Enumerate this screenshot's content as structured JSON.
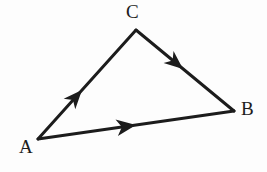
{
  "figure": {
    "kind": "vector-triangle-diagram",
    "width": 267,
    "height": 172,
    "background_color": "#fdfdfd",
    "ink_color": "#1c1c1c"
  },
  "vertices": [
    {
      "id": "A",
      "label": "A",
      "x": 38,
      "y": 139,
      "label_x": 19,
      "label_y": 137
    },
    {
      "id": "B",
      "label": "B",
      "x": 234,
      "y": 111,
      "label_x": 241,
      "label_y": 99
    },
    {
      "id": "C",
      "label": "C",
      "x": 136,
      "y": 30,
      "label_x": 126,
      "label_y": 2
    }
  ],
  "edges": [
    {
      "id": "AC",
      "from": "A",
      "to": "C",
      "x1": 38,
      "y1": 139,
      "x2": 136,
      "y2": 30,
      "arrow_position": 0.45,
      "arrow_x": 82,
      "arrow_y": 90,
      "stroke_width": 3
    },
    {
      "id": "CB",
      "from": "C",
      "to": "B",
      "x1": 136,
      "y1": 30,
      "x2": 234,
      "y2": 111,
      "arrow_position": 0.48,
      "arrow_x": 183,
      "arrow_y": 69,
      "stroke_width": 3
    },
    {
      "id": "AB",
      "from": "A",
      "to": "B",
      "x1": 38,
      "y1": 139,
      "x2": 234,
      "y2": 111,
      "arrow_position": 0.5,
      "arrow_x": 136,
      "arrow_y": 125,
      "stroke_width": 3
    }
  ],
  "labels": {
    "a": "A",
    "b": "B",
    "c": "C"
  }
}
